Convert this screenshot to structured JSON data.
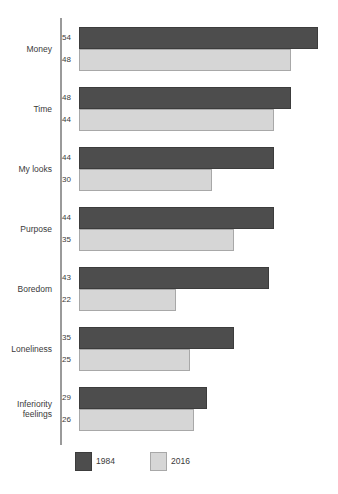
{
  "chart_data": {
    "type": "bar",
    "orientation": "horizontal",
    "title": "",
    "subtitle": "",
    "xlabel": "",
    "ylabel": "",
    "xlim": [
      0,
      60
    ],
    "grid": false,
    "legend_position": "bottom-left",
    "categories": [
      "Money",
      "Time",
      "My looks",
      "Purpose",
      "Boredom",
      "Loneliness",
      "Inferiority feelings"
    ],
    "series": [
      {
        "name": "1984",
        "color": "#4d4d4d",
        "values": [
          54,
          48,
          44,
          44,
          43,
          35,
          29
        ]
      },
      {
        "name": "2016",
        "color": "#d6d6d6",
        "values": [
          48,
          44,
          30,
          35,
          22,
          25,
          26
        ]
      }
    ]
  },
  "legend": {
    "entries": [
      {
        "label": "1984",
        "swatch": "dark-swatch"
      },
      {
        "label": "2016",
        "swatch": "light-swatch"
      }
    ]
  }
}
